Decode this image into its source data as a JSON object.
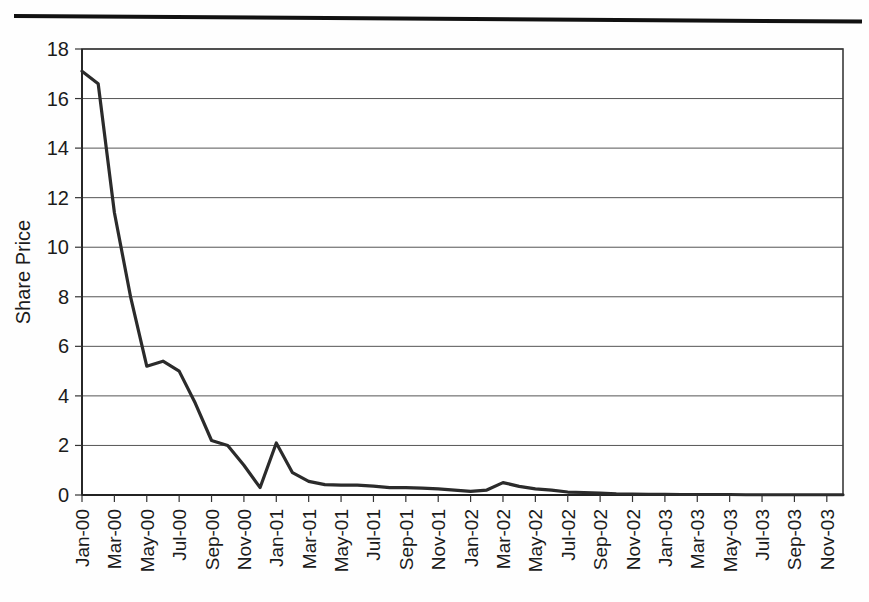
{
  "page": {
    "top_rule": "horizontal-rule"
  },
  "chart_data": {
    "type": "line",
    "title": "",
    "subtitle": "",
    "xlabel": "",
    "ylabel": "Share Price",
    "ylim": [
      0,
      18
    ],
    "yticks": [
      0,
      2,
      4,
      6,
      8,
      10,
      12,
      14,
      16,
      18
    ],
    "ytick_labels": [
      "0",
      "2",
      "4",
      "6",
      "8",
      "10",
      "12",
      "14",
      "16",
      "18"
    ],
    "grid": true,
    "grid_axis": "y",
    "legend": false,
    "legend_position": "none",
    "line_color": "#2b2b2b",
    "xtick_labels": [
      "Jan-00",
      "Mar-00",
      "May-00",
      "Jul-00",
      "Sep-00",
      "Nov-00",
      "Jan-01",
      "Mar-01",
      "May-01",
      "Jul-01",
      "Sep-01",
      "Nov-01",
      "Jan-02",
      "Mar-02",
      "May-02",
      "Jul-02",
      "Sep-02",
      "Nov-02",
      "Jan-03",
      "Mar-03",
      "May-03",
      "Jul-03",
      "Sep-03",
      "Nov-03"
    ],
    "x": [
      "Jan-00",
      "Feb-00",
      "Mar-00",
      "Apr-00",
      "May-00",
      "Jun-00",
      "Jul-00",
      "Aug-00",
      "Sep-00",
      "Oct-00",
      "Nov-00",
      "Dec-00",
      "Jan-01",
      "Feb-01",
      "Mar-01",
      "Apr-01",
      "May-01",
      "Jun-01",
      "Jul-01",
      "Aug-01",
      "Sep-01",
      "Oct-01",
      "Nov-01",
      "Dec-01",
      "Jan-02",
      "Feb-02",
      "Mar-02",
      "Apr-02",
      "May-02",
      "Jun-02",
      "Jul-02",
      "Aug-02",
      "Sep-02",
      "Oct-02",
      "Nov-02",
      "Dec-02",
      "Jan-03",
      "Feb-03",
      "Mar-03",
      "Apr-03",
      "May-03",
      "Jun-03",
      "Jul-03",
      "Aug-03",
      "Sep-03",
      "Oct-03",
      "Nov-03",
      "Dec-03"
    ],
    "values": [
      17.1,
      16.6,
      11.4,
      8.0,
      5.2,
      5.4,
      5.0,
      3.7,
      2.2,
      2.0,
      1.2,
      0.3,
      2.1,
      0.9,
      0.55,
      0.42,
      0.4,
      0.4,
      0.36,
      0.3,
      0.3,
      0.28,
      0.25,
      0.2,
      0.15,
      0.2,
      0.5,
      0.35,
      0.25,
      0.2,
      0.12,
      0.1,
      0.08,
      0.05,
      0.04,
      0.03,
      0.03,
      0.02,
      0.02,
      0.02,
      0.02,
      0.01,
      0.01,
      0.01,
      0.01,
      0.01,
      0.01,
      0.01
    ]
  }
}
